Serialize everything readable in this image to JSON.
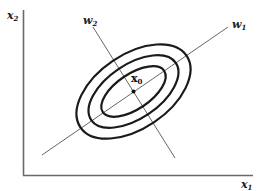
{
  "diagram": {
    "axes": {
      "horizontal": {
        "label": "x",
        "subscript": "1"
      },
      "vertical": {
        "label": "x",
        "subscript": "2"
      }
    },
    "principal_axes": [
      {
        "name": "w1",
        "label": "w",
        "subscript": "1"
      },
      {
        "name": "w2",
        "label": "w",
        "subscript": "2"
      }
    ],
    "center": {
      "label": "x",
      "subscript": "0"
    },
    "contours": {
      "count": 3,
      "shape": "ellipse",
      "orientation": "major axis along w1"
    },
    "colors": {
      "axes": "#6a6a6a",
      "principal_axes": "#555555",
      "contours": "#1a1a1a",
      "text": "#222222",
      "background": "#ffffff"
    }
  }
}
